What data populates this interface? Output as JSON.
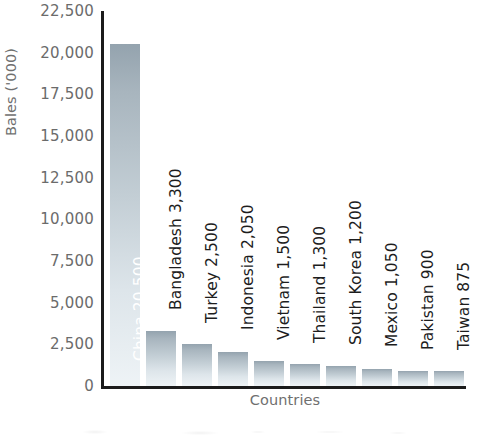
{
  "chart_data": {
    "type": "bar",
    "title": "",
    "xlabel": "Countries",
    "ylabel": "Bales ('000)",
    "categories": [
      "China",
      "Bangladesh",
      "Turkey",
      "Indonesia",
      "Vietnam",
      "Thailand",
      "South Korea",
      "Mexico",
      "Pakistan",
      "Taiwan"
    ],
    "values": [
      20500,
      3300,
      2500,
      2050,
      1500,
      1300,
      1200,
      1050,
      900,
      875
    ],
    "value_labels": [
      "20,500",
      "3,300",
      "2,500",
      "2,050",
      "1,500",
      "1,300",
      "1,200",
      "1,050",
      "900",
      "875"
    ],
    "bar_labels": [
      "China  20,500",
      "Bangladesh  3,300",
      "Turkey  2,500",
      "Indonesia  2,050",
      "Vietnam  1,500",
      "Thailand  1,300",
      "South Korea  1,200",
      "Mexico  1,050",
      "Pakistan  900",
      "Taiwan  875"
    ],
    "label_placement": [
      "inside",
      "outside",
      "outside",
      "outside",
      "outside",
      "outside",
      "outside",
      "outside",
      "outside",
      "outside"
    ],
    "ylim": [
      0,
      22500
    ],
    "ytick_step": 2500,
    "yticks": [
      22500,
      20000,
      17500,
      15000,
      12500,
      10000,
      7500,
      5000,
      2500,
      0
    ],
    "ytick_labels": [
      "22,500",
      "20,000",
      "17,500",
      "15,000",
      "12,500",
      "10,000",
      "7,500",
      "5,000",
      "2,500",
      "0"
    ],
    "grid": false,
    "legend": false,
    "legend_position": "none",
    "orientation": "vertical",
    "colors": {
      "bar_top": "#94a3ae",
      "bar_bottom": "#eef3f6",
      "axis_line": "#1b1b1b",
      "tick_label": "#6b6b6b",
      "axis_title": "#6f6f6f",
      "label_outside": "#1d1d1d",
      "label_inside": "#ffffff",
      "background": "#ffffff"
    }
  }
}
